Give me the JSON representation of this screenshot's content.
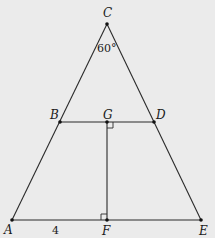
{
  "diagram": {
    "points": {
      "A": {
        "label": "A",
        "x": 12,
        "y": 220,
        "lx": 4,
        "ly": 233
      },
      "B": {
        "label": "B",
        "x": 60,
        "y": 122,
        "lx": 50,
        "ly": 118
      },
      "C": {
        "label": "C",
        "x": 107,
        "y": 24,
        "lx": 104,
        "ly": 18
      },
      "D": {
        "label": "D",
        "x": 154,
        "y": 122,
        "lx": 156,
        "ly": 118
      },
      "E": {
        "label": "E",
        "x": 201,
        "y": 220,
        "lx": 201,
        "ly": 234
      },
      "F": {
        "label": "F",
        "x": 107,
        "y": 220,
        "lx": 102,
        "ly": 234
      },
      "G": {
        "label": "G",
        "x": 107,
        "y": 122,
        "lx": 103,
        "ly": 118
      }
    },
    "segments": [
      [
        "A",
        "C"
      ],
      [
        "C",
        "E"
      ],
      [
        "A",
        "E"
      ],
      [
        "B",
        "D"
      ],
      [
        "G",
        "F"
      ]
    ],
    "annotations": {
      "angle_C": "60°",
      "length_AF": "4"
    },
    "right_angles": [
      "G",
      "F"
    ]
  }
}
